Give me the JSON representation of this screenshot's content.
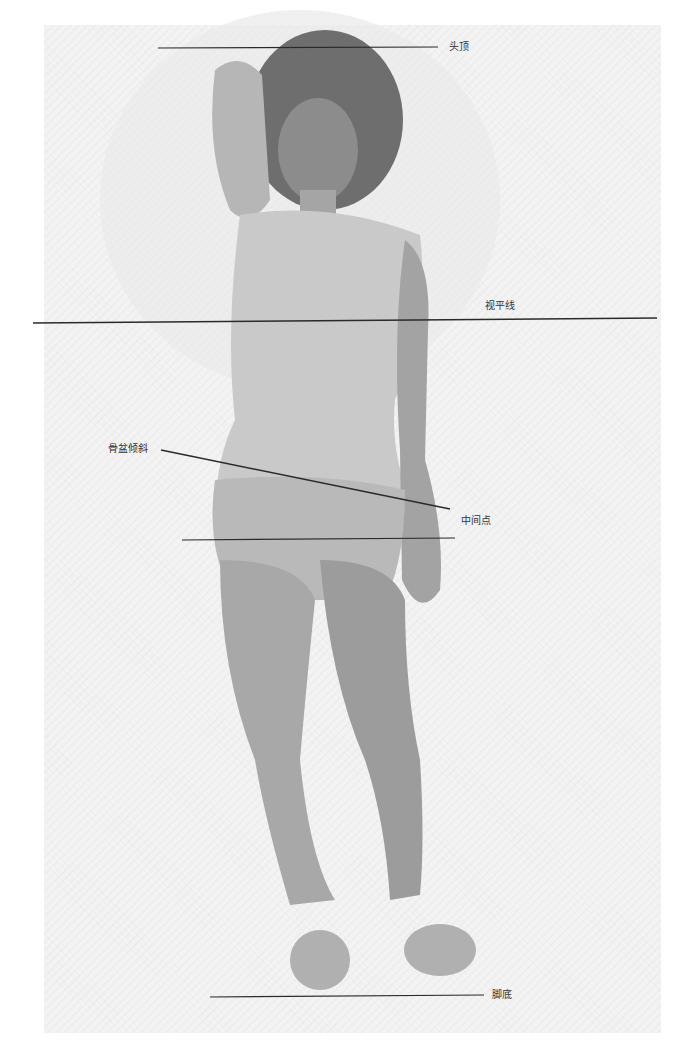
{
  "diagram": {
    "type": "figure-proportion-guide",
    "colors": {
      "page_background": "#ffffff",
      "paper": "#f3f3f3",
      "guide_line": "#2a2a2a",
      "label_text": "#333333",
      "graphite_dark": "#5a5a5a",
      "graphite_mid": "#8a8a8a",
      "graphite_light": "#c4c4c4"
    },
    "guides": [
      {
        "id": "top-of-head",
        "label": "头顶",
        "x1": 158,
        "y1": 48,
        "x2": 438,
        "y2": 47,
        "label_x": 449,
        "label_y": 41
      },
      {
        "id": "eye-level",
        "label": "视平线",
        "x1": 33,
        "y1": 323,
        "x2": 657,
        "y2": 318,
        "label_x": 485,
        "label_y": 300
      },
      {
        "id": "pelvic-tilt",
        "label": "骨盆倾斜",
        "x1": 161,
        "y1": 450,
        "x2": 450,
        "y2": 509,
        "label_x": 108,
        "label_y": 443
      },
      {
        "id": "midpoint",
        "label": "中间点",
        "x1": 182,
        "y1": 540,
        "x2": 455,
        "y2": 538,
        "label_x": 461,
        "label_y": 515
      },
      {
        "id": "bottom-of-feet",
        "label": "脚底",
        "x1": 210,
        "y1": 997,
        "x2": 484,
        "y2": 995,
        "label_x": 492,
        "label_y": 989
      }
    ]
  }
}
